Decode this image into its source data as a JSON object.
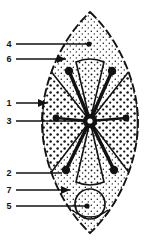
{
  "figure": {
    "caption": "",
    "background_color": "#ffffff",
    "ink_color": "#121212",
    "width": 152,
    "height": 244,
    "specimen": {
      "outline_shape": "pointed-oval",
      "fill_pattern": "stipple",
      "sectors": 4,
      "hub": "dark-central-node",
      "spokes": 6,
      "basal_structure": "circle"
    }
  },
  "labels": [
    {
      "id": "label-4",
      "text": "4",
      "text_x": 9,
      "text_y": 47,
      "line_x1": 16,
      "line_y1": 44,
      "line_x2": 89,
      "line_y2": 44,
      "tip_x": 89,
      "tip_y": 44,
      "tip": "dot"
    },
    {
      "id": "label-6",
      "text": "6",
      "text_x": 9,
      "text_y": 62,
      "line_x1": 16,
      "line_y1": 59,
      "line_x2": 66,
      "line_y2": 59,
      "tip_x": 66,
      "tip_y": 59,
      "tip": "arrow"
    },
    {
      "id": "label-1",
      "text": "1",
      "text_x": 9,
      "text_y": 106,
      "line_x1": 16,
      "line_y1": 103,
      "line_x2": 47,
      "line_y2": 103,
      "tip_x": 47,
      "tip_y": 103,
      "tip": "arrow"
    },
    {
      "id": "label-3",
      "text": "3",
      "text_x": 9,
      "text_y": 124,
      "line_x1": 16,
      "line_y1": 121,
      "line_x2": 84,
      "line_y2": 121,
      "tip_x": 84,
      "tip_y": 121,
      "tip": "plain"
    },
    {
      "id": "label-2",
      "text": "2",
      "text_x": 9,
      "text_y": 176,
      "line_x1": 16,
      "line_y1": 173,
      "line_x2": 62,
      "line_y2": 173,
      "tip_x": 62,
      "tip_y": 173,
      "tip": "plain"
    },
    {
      "id": "label-7",
      "text": "7",
      "text_x": 9,
      "text_y": 193,
      "line_x1": 16,
      "line_y1": 190,
      "line_x2": 70,
      "line_y2": 190,
      "tip_x": 70,
      "tip_y": 190,
      "tip": "arrow"
    },
    {
      "id": "label-5",
      "text": "5",
      "text_x": 9,
      "text_y": 209,
      "line_x1": 16,
      "line_y1": 206,
      "line_x2": 87,
      "line_y2": 206,
      "tip_x": 87,
      "tip_y": 206,
      "tip": "dot"
    }
  ],
  "spokes": [
    {
      "id": "spoke-upper-left",
      "x1": 90,
      "y1": 121,
      "x2": 69,
      "y2": 71,
      "knob_r": 4.2
    },
    {
      "id": "spoke-upper-right",
      "x1": 90,
      "y1": 121,
      "x2": 112,
      "y2": 71,
      "knob_r": 4.2
    },
    {
      "id": "spoke-left",
      "x1": 90,
      "y1": 121,
      "x2": 56,
      "y2": 118,
      "knob_r": 3.4
    },
    {
      "id": "spoke-right",
      "x1": 90,
      "y1": 121,
      "x2": 126,
      "y2": 118,
      "knob_r": 3.4
    },
    {
      "id": "spoke-lower-left",
      "x1": 90,
      "y1": 121,
      "x2": 66,
      "y2": 170,
      "knob_r": 4.2
    },
    {
      "id": "spoke-lower-right",
      "x1": 90,
      "y1": 121,
      "x2": 114,
      "y2": 170,
      "knob_r": 4.2
    }
  ]
}
